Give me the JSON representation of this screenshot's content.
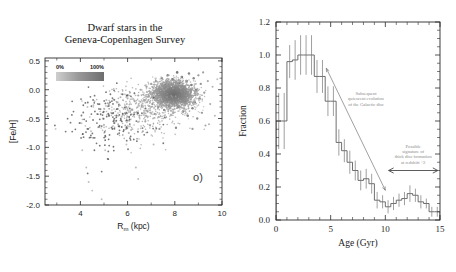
{
  "figure": {
    "panels": [
      "left",
      "right"
    ]
  },
  "left_panel": {
    "title": "Dwarf stars in the\nGeneva-Copenhagen Survey",
    "tag": "o)",
    "colorbar": {
      "min_label": "0%",
      "max_label": "100%"
    }
  },
  "right_panel": {
    "title": "Red Giant stars in SAGA",
    "annotation_1": "Subsequent\nquiescent evolution\nof the Galactic disc",
    "annotation_2": "Possible\nsignature of\nthick disc formation\nat redshift ~2"
  },
  "chart_data": [
    {
      "type": "scatter",
      "title": "Dwarf stars in the Geneva-Copenhagen Survey",
      "xlabel": "R_m (kpc)",
      "ylabel": "[Fe/H]",
      "xlim": [
        2.5,
        10
      ],
      "ylim": [
        -2.0,
        0.55
      ],
      "xticks": [
        4,
        6,
        8,
        10
      ],
      "xticklabels": [
        "4",
        "6",
        "8",
        "10"
      ],
      "yticks": [
        0.5,
        0.0,
        -0.5,
        -1.0,
        -1.5,
        -2.0
      ],
      "yticklabels": [
        "0.5",
        "0.0",
        "-0.5",
        "-1.0",
        "-1.5",
        "-2.0"
      ],
      "grid": false,
      "legend": "colorbar 0% to 100%",
      "colormap_gray": true,
      "points": [
        [
          2.95,
          -0.68,
          0.15
        ],
        [
          3.95,
          -0.58,
          0.15
        ],
        [
          4.05,
          -0.58,
          0.15
        ],
        [
          4.08,
          -1.05,
          0.2
        ],
        [
          4.25,
          -1.35,
          0.2
        ],
        [
          4.3,
          -0.3,
          0.2
        ],
        [
          4.35,
          -1.6,
          0.2
        ],
        [
          4.5,
          -1.75,
          0.2
        ],
        [
          4.55,
          -0.27,
          0.2
        ],
        [
          4.6,
          -0.2,
          0.2
        ],
        [
          4.7,
          -0.42,
          0.2
        ],
        [
          4.9,
          -1.9,
          0.2
        ],
        [
          4.95,
          -0.5,
          0.2
        ],
        [
          5.0,
          -0.33,
          0.2
        ],
        [
          5.05,
          -1.05,
          0.2
        ],
        [
          5.1,
          -0.18,
          0.25
        ],
        [
          5.2,
          -0.25,
          0.25
        ],
        [
          5.3,
          -0.4,
          0.25
        ],
        [
          5.4,
          -0.17,
          0.25
        ],
        [
          5.5,
          -0.55,
          0.25
        ],
        [
          5.55,
          -0.22,
          0.3
        ],
        [
          5.6,
          -0.6,
          0.3
        ],
        [
          5.7,
          -0.13,
          0.3
        ],
        [
          5.75,
          -0.47,
          0.3
        ],
        [
          5.8,
          -0.08,
          0.3
        ],
        [
          5.9,
          -0.62,
          0.3
        ],
        [
          5.95,
          -0.3,
          0.35
        ],
        [
          6.0,
          -0.15,
          0.35
        ],
        [
          6.05,
          -0.75,
          0.3
        ],
        [
          6.1,
          -0.05,
          0.35
        ],
        [
          6.2,
          -0.35,
          0.35
        ],
        [
          6.3,
          -0.2,
          0.4
        ],
        [
          6.35,
          -1.35,
          0.25
        ],
        [
          6.4,
          -0.85,
          0.3
        ],
        [
          6.45,
          -0.1,
          0.4
        ],
        [
          6.5,
          -0.45,
          0.4
        ],
        [
          6.55,
          0.0,
          0.4
        ],
        [
          6.6,
          -0.28,
          0.45
        ],
        [
          6.7,
          -0.18,
          0.45
        ],
        [
          6.75,
          -0.55,
          0.4
        ],
        [
          6.8,
          0.05,
          0.45
        ],
        [
          6.85,
          -0.38,
          0.45
        ],
        [
          6.9,
          -0.12,
          0.5
        ],
        [
          6.95,
          -0.62,
          0.4
        ],
        [
          7.0,
          0.1,
          0.5
        ],
        [
          7.05,
          -0.25,
          0.55
        ],
        [
          7.1,
          -0.05,
          0.6
        ],
        [
          7.15,
          -0.42,
          0.5
        ],
        [
          7.2,
          0.15,
          0.55
        ],
        [
          7.25,
          -0.15,
          0.65
        ],
        [
          7.3,
          -0.3,
          0.6
        ],
        [
          7.35,
          0.02,
          0.7
        ],
        [
          7.4,
          -0.2,
          0.7
        ],
        [
          7.45,
          0.2,
          0.6
        ],
        [
          7.5,
          -0.08,
          0.8
        ],
        [
          7.55,
          -0.35,
          0.65
        ],
        [
          7.6,
          0.08,
          0.85
        ],
        [
          7.65,
          -0.18,
          0.85
        ],
        [
          7.7,
          0.25,
          0.7
        ],
        [
          7.75,
          -0.28,
          0.8
        ],
        [
          7.8,
          0.0,
          0.9
        ],
        [
          7.85,
          -0.12,
          0.9
        ],
        [
          7.9,
          0.18,
          0.85
        ],
        [
          7.95,
          -0.22,
          0.9
        ],
        [
          8.0,
          0.05,
          0.95
        ],
        [
          8.05,
          -0.05,
          0.95
        ],
        [
          8.1,
          0.3,
          0.8
        ],
        [
          8.15,
          -0.3,
          0.85
        ],
        [
          8.2,
          0.12,
          0.9
        ],
        [
          8.25,
          -0.15,
          0.9
        ],
        [
          8.3,
          0.22,
          0.85
        ],
        [
          8.35,
          -0.38,
          0.75
        ],
        [
          8.4,
          0.02,
          0.85
        ],
        [
          8.45,
          -0.2,
          0.85
        ],
        [
          8.5,
          0.15,
          0.8
        ],
        [
          8.55,
          -0.45,
          0.7
        ],
        [
          8.6,
          0.28,
          0.7
        ],
        [
          8.65,
          -0.1,
          0.8
        ],
        [
          8.7,
          0.08,
          0.75
        ],
        [
          8.75,
          -0.32,
          0.7
        ],
        [
          8.8,
          0.2,
          0.65
        ],
        [
          8.85,
          -0.22,
          0.7
        ],
        [
          8.9,
          0.0,
          0.7
        ],
        [
          8.95,
          -0.5,
          0.6
        ],
        [
          9.0,
          0.25,
          0.55
        ],
        [
          9.05,
          -0.15,
          0.6
        ],
        [
          9.1,
          0.1,
          0.55
        ],
        [
          9.15,
          -0.4,
          0.5
        ],
        [
          9.2,
          0.3,
          0.45
        ],
        [
          9.25,
          -0.05,
          0.5
        ],
        [
          9.3,
          -0.62,
          0.4
        ],
        [
          9.4,
          0.15,
          0.4
        ],
        [
          9.5,
          -0.25,
          0.35
        ],
        [
          9.6,
          0.05,
          0.3
        ],
        [
          9.7,
          -0.45,
          0.25
        ],
        [
          9.8,
          0.18,
          0.2
        ],
        [
          6.45,
          -1.55,
          0.2
        ],
        [
          5.95,
          -0.95,
          0.2
        ],
        [
          7.1,
          -0.95,
          0.25
        ],
        [
          4.45,
          -0.72,
          0.2
        ],
        [
          4.75,
          -0.65,
          0.2
        ],
        [
          5.35,
          -0.68,
          0.25
        ],
        [
          6.15,
          -0.7,
          0.3
        ],
        [
          6.65,
          -0.72,
          0.35
        ],
        [
          7.35,
          -0.68,
          0.5
        ],
        [
          8.05,
          -0.66,
          0.6
        ],
        [
          8.75,
          -0.68,
          0.5
        ],
        [
          9.45,
          -0.6,
          0.3
        ]
      ]
    },
    {
      "type": "line",
      "subtype": "step-histogram",
      "title": "Red Giant stars in SAGA",
      "xlabel": "Age (Gyr)",
      "ylabel": "Fraction",
      "xlim": [
        0,
        15
      ],
      "ylim": [
        0.0,
        1.2
      ],
      "xticks": [
        0,
        5,
        10,
        15
      ],
      "xticklabels": [
        "0",
        "5",
        "10",
        "15"
      ],
      "yticks": [
        0.0,
        0.2,
        0.4,
        0.6,
        0.8,
        1.0,
        1.2
      ],
      "yticklabels": [
        "0.0",
        "0.2",
        "0.4",
        "0.6",
        "0.8",
        "1.0",
        "1.2"
      ],
      "grid": false,
      "bin_width": 0.5,
      "bin_centers": [
        0.25,
        0.75,
        1.25,
        1.75,
        2.25,
        2.75,
        3.25,
        3.75,
        4.25,
        4.75,
        5.25,
        5.75,
        6.25,
        6.75,
        7.25,
        7.75,
        8.25,
        8.75,
        9.25,
        9.75,
        10.25,
        10.75,
        11.25,
        11.75,
        12.25,
        12.75,
        13.25,
        13.75,
        14.25,
        14.75
      ],
      "values": [
        0.6,
        0.6,
        0.96,
        0.97,
        1.0,
        1.0,
        1.0,
        0.87,
        0.87,
        0.72,
        0.72,
        0.47,
        0.42,
        0.35,
        0.3,
        0.24,
        0.25,
        0.22,
        0.12,
        0.11,
        0.08,
        0.1,
        0.12,
        0.13,
        0.16,
        0.15,
        0.11,
        0.1,
        0.05,
        0.05
      ],
      "errors": [
        0.17,
        0.17,
        0.1,
        0.12,
        0.12,
        0.12,
        0.12,
        0.1,
        0.1,
        0.09,
        0.09,
        0.08,
        0.07,
        0.07,
        0.06,
        0.06,
        0.06,
        0.06,
        0.05,
        0.04,
        0.04,
        0.04,
        0.04,
        0.04,
        0.05,
        0.04,
        0.04,
        0.03,
        0.03,
        0.03
      ],
      "annotations": [
        {
          "text": "Subsequent quiescent evolution of the Galactic disc",
          "arrow_from": [
            4.6,
            0.92
          ],
          "arrow_to": [
            10.0,
            0.18
          ]
        },
        {
          "text": "Possible signature of thick disc formation at redshift ~2",
          "span_from": [
            10.3,
            0.3
          ],
          "span_to": [
            14.8,
            0.3
          ]
        }
      ]
    }
  ]
}
